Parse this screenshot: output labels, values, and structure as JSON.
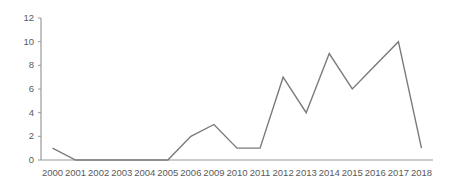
{
  "chart_data": {
    "type": "line",
    "title": "",
    "subtitle": "",
    "xlabel": "",
    "ylabel": "",
    "categories": [
      "2000",
      "2001",
      "2002",
      "2003",
      "2004",
      "2005",
      "2006",
      "2009",
      "2010",
      "2011",
      "2012",
      "2013",
      "2014",
      "2015",
      "2016",
      "2017",
      "2018"
    ],
    "values": [
      1,
      0,
      0,
      0,
      0,
      0,
      2,
      3,
      1,
      1,
      7,
      4,
      9,
      6,
      8,
      10,
      1
    ],
    "series": [
      {
        "name": "",
        "values": [
          1,
          0,
          0,
          0,
          0,
          0,
          2,
          3,
          1,
          1,
          7,
          4,
          9,
          6,
          8,
          10,
          1
        ]
      }
    ],
    "ylim": [
      0,
      12
    ],
    "yticks": [
      0,
      2,
      4,
      6,
      8,
      10,
      12
    ],
    "ytick_labels": [
      "0",
      "2",
      "4",
      "6",
      "8",
      "10",
      "12"
    ],
    "grid": false,
    "legend": "none",
    "markers": false,
    "annotations": []
  },
  "style": {
    "line_color": "#7a7a7a",
    "axis_color": "#9a9a9a",
    "tick_label_color": "#5a5a5a",
    "background_color": "#ffffff",
    "line_width": 1.4
  },
  "axes": {
    "y_axis_name": "value-axis",
    "x_axis_name": "year-axis"
  }
}
